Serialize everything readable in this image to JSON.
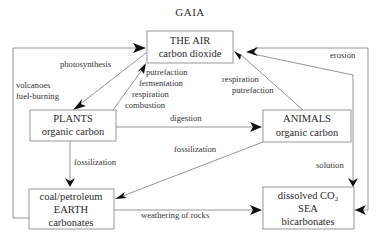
{
  "title": "GAIA",
  "nodes": {
    "air": {
      "lines": [
        "THE AIR",
        "carbon dioxide"
      ]
    },
    "plants": {
      "lines": [
        "PLANTS",
        "organic carbon"
      ]
    },
    "animals": {
      "lines": [
        "ANIMALS",
        "organic carbon"
      ]
    },
    "earth": {
      "lines": [
        "coal/petroleum",
        "EARTH",
        "carbonates"
      ]
    },
    "sea": {
      "line1_main": "dissolved CO",
      "line1_sub": "2",
      "lines": [
        "SEA",
        "bicarbonates"
      ]
    }
  },
  "edges": {
    "photosynthesis": {
      "label": "photosynthesis"
    },
    "volcanoes": {
      "lines": [
        "volcanoes",
        "fuel-burning"
      ]
    },
    "plants_to_air": {
      "lines": [
        "putrefaction",
        "fermentation",
        "respiration",
        "combustion"
      ]
    },
    "animals_to_air": {
      "lines": [
        "respiration",
        "putrefaction"
      ]
    },
    "erosion": {
      "label": "erosion"
    },
    "digestion": {
      "label": "digestion"
    },
    "plants_fossilization": {
      "label": "fossilization"
    },
    "animals_fossilization": {
      "label": "fossilization"
    },
    "solution": {
      "label": "solution"
    },
    "weathering": {
      "label": "weathering of rocks"
    }
  }
}
